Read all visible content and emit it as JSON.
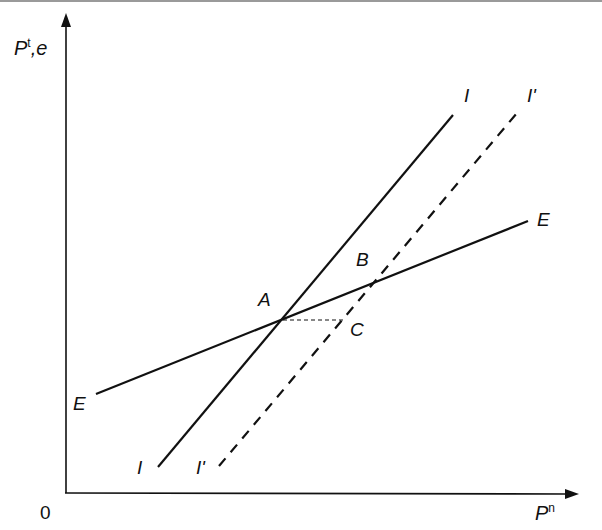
{
  "diagram": {
    "type": "economics-line-diagram",
    "axes": {
      "y_label": {
        "main": "P",
        "sup": "t",
        "suffix": ",e"
      },
      "x_label": {
        "main": "P",
        "sup": "n"
      },
      "origin_label": "0"
    },
    "lines": [
      {
        "id": "E",
        "label_start": "E",
        "label_end": "E",
        "style": "solid",
        "from": [
          96,
          394
        ],
        "to": [
          528,
          221
        ]
      },
      {
        "id": "I",
        "label_start": "I",
        "label_end": "I",
        "style": "solid",
        "from": [
          158,
          467
        ],
        "to": [
          453,
          115
        ]
      },
      {
        "id": "I_prime",
        "label_start": "I'",
        "label_end": "I'",
        "style": "dashed",
        "from": [
          219,
          466
        ],
        "to": [
          517,
          113
        ]
      },
      {
        "id": "A_to_C",
        "style": "dotted-dashed",
        "from": [
          283,
          320
        ],
        "to": [
          345,
          320
        ]
      }
    ],
    "points": [
      {
        "label": "A",
        "at": [
          283,
          319
        ]
      },
      {
        "label": "B",
        "at": [
          371,
          285
        ]
      },
      {
        "label": "C",
        "at": [
          345,
          320
        ]
      }
    ],
    "colors": {
      "ink": "#111111",
      "background": "#ffffff",
      "top_strip": "#9a9a9a"
    }
  }
}
